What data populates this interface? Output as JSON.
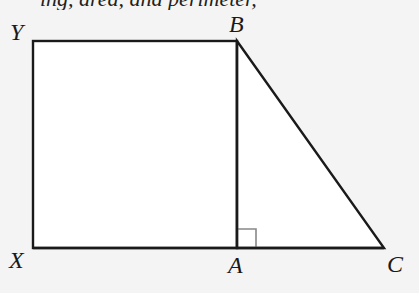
{
  "figure": {
    "background_color": "#f4f4f4",
    "fill_color": "#ffffff",
    "stroke_color": "#1a1a1a",
    "right_angle_marker_color": "#888888",
    "cut_off_text": "ing, area, and perimeter,",
    "vertices": {
      "Y": {
        "label": "Y",
        "x": 33,
        "y": 41
      },
      "B": {
        "label": "B",
        "x": 237,
        "y": 41
      },
      "X": {
        "label": "X",
        "x": 33,
        "y": 248
      },
      "A": {
        "label": "A",
        "x": 237,
        "y": 248
      },
      "C": {
        "label": "C",
        "x": 384,
        "y": 248
      }
    },
    "shapes": [
      {
        "type": "rectangle",
        "name": "XYBA",
        "vertices": [
          "X",
          "Y",
          "B",
          "A"
        ]
      },
      {
        "type": "right-triangle",
        "name": "ABC",
        "vertices": [
          "A",
          "B",
          "C"
        ],
        "right_angle_at": "A"
      }
    ]
  }
}
